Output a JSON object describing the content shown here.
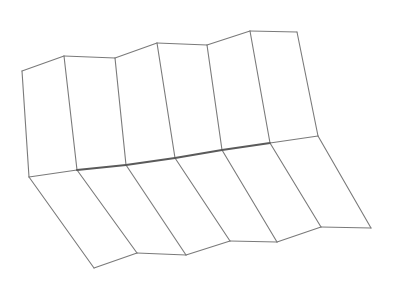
{
  "diagram": {
    "type": "folded-surface-line-drawing",
    "colors": {
      "background": "#ffffff",
      "edge": "#7a7a7a",
      "crease": "#5a5a5a"
    },
    "vertices": {
      "top": [
        [
          22,
          71
        ],
        [
          64,
          56
        ],
        [
          115,
          58
        ],
        [
          157,
          43
        ],
        [
          207,
          45
        ],
        [
          250,
          31
        ],
        [
          297,
          32
        ]
      ],
      "middle": [
        [
          29,
          177
        ],
        [
          77,
          170
        ],
        [
          126,
          165
        ],
        [
          175,
          158
        ],
        [
          222,
          150
        ],
        [
          270,
          143
        ],
        [
          318,
          136
        ]
      ],
      "bottom": [
        [
          94,
          268
        ],
        [
          137,
          253
        ],
        [
          186,
          255
        ],
        [
          230,
          241
        ],
        [
          277,
          242
        ],
        [
          321,
          227
        ],
        [
          371,
          228
        ]
      ]
    }
  }
}
